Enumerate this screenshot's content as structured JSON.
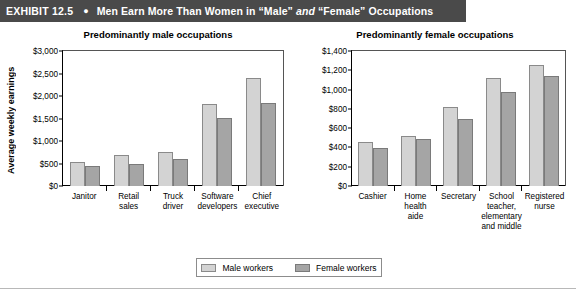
{
  "header": {
    "exhibit_label": "EXHIBIT 12.5",
    "bullet_icon": "bullet-dot-icon",
    "title_part1": "Men Earn More Than Women in “Male” ",
    "title_italic": "and",
    "title_part2": " “Female” Occupations",
    "background_color": "#4a4a4a",
    "text_color": "#ffffff"
  },
  "legend": {
    "items": [
      {
        "label": "Male workers",
        "color": "#d3d3d3"
      },
      {
        "label": "Female workers",
        "color": "#a5a5a5"
      }
    ]
  },
  "chart_data": [
    {
      "type": "bar",
      "title": "Predominantly male occupations",
      "xlabel": "",
      "ylabel": "Average weekly earnings",
      "ylim": [
        0,
        3000
      ],
      "ytick_labels": [
        "$3,000",
        "$2,500",
        "$2,000",
        "$1,500",
        "$1,000",
        "$500",
        "$0"
      ],
      "ytick_values": [
        3000,
        2500,
        2000,
        1500,
        1000,
        500,
        0
      ],
      "grid": false,
      "legend_position": "bottom-center",
      "categories": [
        "Janitor",
        "Retail sales",
        "Truck driver",
        "Software developers",
        "Chief executive"
      ],
      "category_lines": [
        [
          "Janitor"
        ],
        [
          "Retail",
          "sales"
        ],
        [
          "Truck",
          "driver"
        ],
        [
          "Software",
          "developers"
        ],
        [
          "Chief",
          "executive"
        ]
      ],
      "series": [
        {
          "name": "Male workers",
          "color": "#d3d3d3",
          "values": [
            540,
            690,
            750,
            1820,
            2400
          ]
        },
        {
          "name": "Female workers",
          "color": "#a5a5a5",
          "values": [
            450,
            490,
            610,
            1520,
            1840
          ]
        }
      ]
    },
    {
      "type": "bar",
      "title": "Predominantly female occupations",
      "xlabel": "",
      "ylabel": "",
      "ylim": [
        0,
        1400
      ],
      "ytick_labels": [
        "$1,400",
        "$1,200",
        "$1,000",
        "$800",
        "$600",
        "$400",
        "$200",
        "$0"
      ],
      "ytick_values": [
        1400,
        1200,
        1000,
        800,
        600,
        400,
        200,
        0
      ],
      "grid": false,
      "legend_position": "bottom-center",
      "categories": [
        "Cashier",
        "Home health aide",
        "Secretary",
        "School teacher, elementary and middle",
        "Registered nurse"
      ],
      "category_lines": [
        [
          "Cashier"
        ],
        [
          "Home",
          "health",
          "aide"
        ],
        [
          "Secretary"
        ],
        [
          "School",
          "teacher,",
          "elementary",
          "and middle"
        ],
        [
          "Registered",
          "nurse"
        ]
      ],
      "series": [
        {
          "name": "Male workers",
          "color": "#d3d3d3",
          "values": [
            460,
            520,
            820,
            1120,
            1250
          ]
        },
        {
          "name": "Female workers",
          "color": "#a5a5a5",
          "values": [
            390,
            485,
            700,
            975,
            1140
          ]
        }
      ]
    }
  ]
}
